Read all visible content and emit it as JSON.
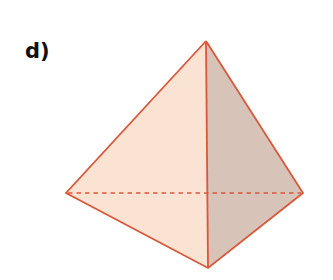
{
  "figure": {
    "label": "d)",
    "shape": "tetrahedron",
    "vertices": {
      "apex": [
        206,
        41
      ],
      "left": [
        66,
        193
      ],
      "right": [
        303,
        193
      ],
      "bottom": [
        208,
        268
      ]
    },
    "colors": {
      "edge": "#d9583a",
      "front_face": "#fbe3d3",
      "side_face": "#d8c3b8",
      "background": "#ffffff"
    },
    "hidden_edge": {
      "style": "dashed",
      "from": "left",
      "to": "right"
    }
  }
}
